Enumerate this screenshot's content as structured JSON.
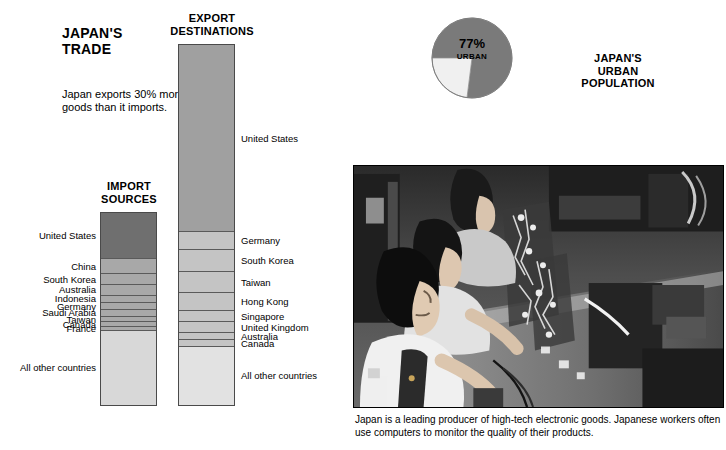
{
  "intro": "Japan exports 30% more goods than it imports.",
  "import_heading": "IMPORT\nSOURCES",
  "export_heading": "EXPORT\nDESTINATIONS",
  "pie": {
    "percent_label": "77%",
    "sub_label": "URBAN",
    "title": "JAPAN'S\nURBAN\nPOPULATION"
  },
  "photo": {
    "caption": "Japan is a leading producer of high-tech electronic goods.  Japanese workers often use computers to monitor the quality of their products."
  },
  "colors": {
    "dark_gray": "#6f6f6f",
    "mid_gray": "#a8a8a8",
    "light_gray": "#d8d8d8",
    "pale_gray": "#e8e8e8",
    "outline": "#4a4a4a",
    "text": "#000000",
    "background": "#ffffff"
  },
  "chart_data": [
    {
      "type": "bar",
      "title": "IMPORT SOURCES",
      "orientation": "vertical-stacked",
      "label_side": "left",
      "total_height_px": 194,
      "categories": [
        "United States",
        "China",
        "South Korea",
        "Australia",
        "Indonesia",
        "Germany",
        "Saudi Arabia",
        "Taiwan",
        "Canada",
        "France",
        "All other countries"
      ],
      "values": [
        24.0,
        8.0,
        5.5,
        5.5,
        4.0,
        3.5,
        3.5,
        3.0,
        2.5,
        2.0,
        38.5
      ],
      "units": "percent of total imports",
      "segment_colors": [
        "#6f6f6f",
        "#a8a8a8",
        "#a8a8a8",
        "#a8a8a8",
        "#a8a8a8",
        "#a8a8a8",
        "#a8a8a8",
        "#a8a8a8",
        "#a8a8a8",
        "#a8a8a8",
        "#d8d8d8"
      ]
    },
    {
      "type": "bar",
      "title": "EXPORT DESTINATIONS",
      "orientation": "vertical-stacked",
      "label_side": "right",
      "total_height_px": 362,
      "categories": [
        "United States",
        "Germany",
        "South Korea",
        "Taiwan",
        "Hong Kong",
        "Singapore",
        "United Kingdom",
        "Australia",
        "Canada",
        "All other countries"
      ],
      "values": [
        52.0,
        5.0,
        6.0,
        6.0,
        5.0,
        3.0,
        3.0,
        2.0,
        2.0,
        16.0
      ],
      "units": "percent of total exports",
      "segment_colors": [
        "#a0a0a0",
        "#c4c4c4",
        "#c4c4c4",
        "#c4c4c4",
        "#c4c4c4",
        "#c4c4c4",
        "#c4c4c4",
        "#c4c4c4",
        "#c4c4c4",
        "#e2e2e2"
      ]
    },
    {
      "type": "pie",
      "title": "JAPAN'S URBAN POPULATION",
      "labels": [
        "Urban",
        "Rural"
      ],
      "values": [
        77,
        23
      ],
      "slice_colors": [
        "#7a7a7a",
        "#f0f0f0"
      ],
      "start_angle_deg": 180,
      "annotation": "77% URBAN"
    }
  ]
}
